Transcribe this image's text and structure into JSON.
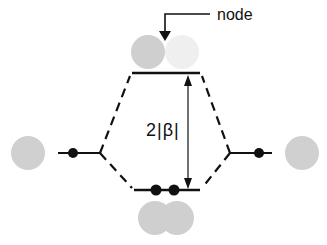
{
  "diagram": {
    "type": "molecular orbital energy level diagram",
    "labels": {
      "node": "node",
      "energy_gap": "2|β|"
    },
    "orbitals": [
      {
        "name": "left-atomic-orbital",
        "electrons": 1
      },
      {
        "name": "right-atomic-orbital",
        "electrons": 1
      },
      {
        "name": "antibonding-orbital",
        "electrons": 0,
        "has_node": true
      },
      {
        "name": "bonding-orbital",
        "electrons": 2
      }
    ],
    "colors": {
      "line": "#111111",
      "orbital_lobe_dark": "#cfcfcf",
      "orbital_lobe_light": "#efefef"
    }
  }
}
